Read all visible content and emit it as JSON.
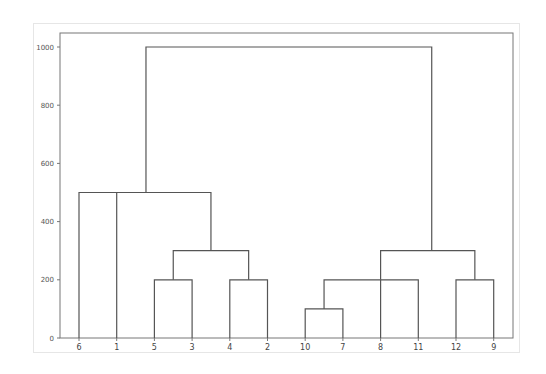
{
  "chart_data": {
    "type": "dendrogram",
    "title": "",
    "xlabel": "",
    "ylabel": "",
    "ylim": [
      0,
      1000
    ],
    "yticks": [
      0,
      200,
      400,
      600,
      800,
      1000
    ],
    "leaves": [
      "6",
      "1",
      "5",
      "3",
      "4",
      "2",
      "10",
      "7",
      "8",
      "11",
      "12",
      "9"
    ],
    "merges": [
      {
        "children": [
          "5",
          "3"
        ],
        "height": 200
      },
      {
        "children": [
          "4",
          "2"
        ],
        "height": 200
      },
      {
        "children": [
          "(5,3)",
          "(4,2)"
        ],
        "height": 300
      },
      {
        "children": [
          "6",
          "1",
          "((5,3),(4,2))"
        ],
        "height": 500
      },
      {
        "children": [
          "10",
          "7"
        ],
        "height": 100
      },
      {
        "children": [
          "(10,7)",
          "8",
          "11"
        ],
        "height": 200
      },
      {
        "children": [
          "12",
          "9"
        ],
        "height": 200
      },
      {
        "children": [
          "((10,7),8,11)",
          "(12,9)"
        ],
        "height": 300
      },
      {
        "children": [
          "left_cluster",
          "right_cluster"
        ],
        "height": 1000
      }
    ],
    "grid": false,
    "line_color": "#555555"
  },
  "axes": {
    "ytick_labels": [
      "0",
      "200",
      "400",
      "600",
      "800",
      "1000"
    ],
    "xtick_labels": [
      "6",
      "1",
      "5",
      "3",
      "4",
      "2",
      "10",
      "7",
      "8",
      "11",
      "12",
      "9"
    ]
  }
}
